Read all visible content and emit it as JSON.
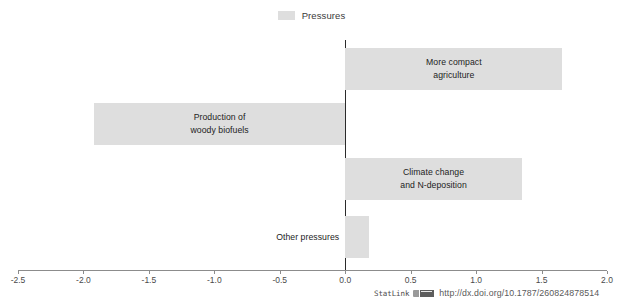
{
  "legend": {
    "entries": [
      {
        "label": "Pressures",
        "color": "#dedede",
        "icon": "legend-swatch"
      }
    ]
  },
  "footer": {
    "statlink_label": "StatLink",
    "statlink_icon": "statlink-barcode-icon",
    "url": "http://dx.doi.org/10.1787/260824878514"
  },
  "chart_data": {
    "type": "bar",
    "orientation": "horizontal",
    "title": "",
    "xlabel": "",
    "ylabel": "",
    "xlim": [
      -2.5,
      2.0
    ],
    "xticks": [
      "-2.5",
      "-2.0",
      "-1.5",
      "-1.0",
      "-0.5",
      "0.0",
      "0.5",
      "1.0",
      "1.5",
      "2.0"
    ],
    "xtick_values": [
      -2.5,
      -2.0,
      -1.5,
      -1.0,
      -0.5,
      0.0,
      0.5,
      1.0,
      1.5,
      2.0
    ],
    "grid": false,
    "legend_position": "top-center",
    "bar_color": "#dedede",
    "zero_line_color": "#2b2b2b",
    "axis_color": "#8c8c8c",
    "categories": [
      "More compact agriculture",
      "Production of woody biofuels",
      "Climate change and N-deposition",
      "Other pressures"
    ],
    "series": [
      {
        "name": "Pressures",
        "values": [
          1.66,
          -1.92,
          1.35,
          0.18
        ]
      }
    ],
    "bars": [
      {
        "label": "More compact\nagriculture",
        "value": 1.66,
        "label_inside": true
      },
      {
        "label": "Production of\nwoody biofuels",
        "value": -1.92,
        "label_inside": true
      },
      {
        "label": "Climate change\nand N-deposition",
        "value": 1.35,
        "label_inside": true
      },
      {
        "label": "Other pressures",
        "value": 0.18,
        "label_inside": false
      }
    ]
  }
}
